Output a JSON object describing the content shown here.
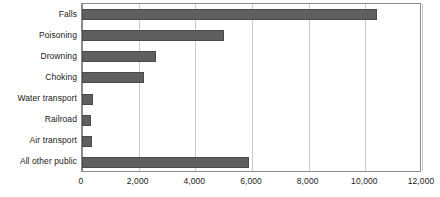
{
  "chart_data": {
    "type": "bar",
    "orientation": "horizontal",
    "title": "",
    "subtitle": "",
    "xlabel": "",
    "ylabel": "",
    "categories": [
      "Falls",
      "Poisoning",
      "Drowning",
      "Choking",
      "Water transport",
      "Railroad",
      "Air transport",
      "All other public"
    ],
    "values": [
      10400,
      5000,
      2600,
      2200,
      400,
      320,
      350,
      5900
    ],
    "xlim": [
      0,
      12000
    ],
    "xticks": [
      0,
      2000,
      4000,
      6000,
      8000,
      10000,
      12000
    ],
    "xtick_labels": [
      "0",
      "2,000",
      "4,000",
      "6,000",
      "8,000",
      "10,000",
      "12,000"
    ],
    "grid": "vertical",
    "legend": "none",
    "annotations": []
  },
  "style": {
    "bar_fill": "#5f5f5f",
    "bar_stroke": "#4a4a4a",
    "gridline_color": "#c9c9c9",
    "frame_color": "#8c8c8c",
    "text_color": "#1a1a1a",
    "background": "#ffffff"
  }
}
